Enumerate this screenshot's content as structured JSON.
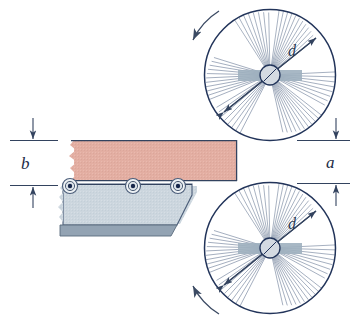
{
  "figure": {
    "labels": {
      "thickness": "b",
      "gap": "a",
      "disc_diameter_top": "d",
      "disc_diameter_bottom": "d"
    }
  },
  "colors": {
    "workpiece_upper": "#e3aea2",
    "workpiece_upper_edge": "#1f3050",
    "support_block": "#ccd6de",
    "support_block_base": "#93a3b3",
    "disc_outline": "#22345a",
    "disc_hatch": "#5c6f8e",
    "hub_fill": "#d4dae2",
    "hub_outline": "#22345a",
    "shaft_bar": "#9fb0bf",
    "roller_outline": "#4a5c78",
    "roller_center": "#16264a",
    "dimension_line": "#33435f",
    "rotation_arrow": "#3b4a63",
    "background": "#ffffff"
  },
  "discs": [
    {
      "name": "upper-cutter-disc",
      "center_x": 270,
      "center_y": 75,
      "radius": 66,
      "sectors": 6,
      "rotation_direction": "counterclockwise",
      "diameter_label": "d"
    },
    {
      "name": "lower-cutter-disc",
      "center_x": 270,
      "center_y": 248,
      "radius": 66,
      "sectors": 6,
      "rotation_direction": "clockwise",
      "diameter_label": "d"
    }
  ],
  "rollers": [
    {
      "name": "roller-1",
      "cx": 70,
      "cy": 186
    },
    {
      "name": "roller-2",
      "cx": 133,
      "cy": 186
    },
    {
      "name": "roller-3",
      "cx": 178,
      "cy": 186
    }
  ],
  "dimensions": [
    {
      "name": "thickness-dimension-b",
      "label": "b",
      "side": "left",
      "top_y": 140,
      "bottom_y": 185
    },
    {
      "name": "gap-dimension-a",
      "label": "a",
      "side": "right",
      "top_y": 140,
      "bottom_y": 183
    }
  ]
}
